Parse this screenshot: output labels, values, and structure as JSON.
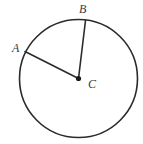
{
  "figure": {
    "kind": "geometry-diagram",
    "background_color": "#ffffff",
    "stroke_color": "#2b2b2b",
    "label_color": "#3a3a3a",
    "dot_color": "#1a1a1a",
    "circle": {
      "center_x": 78.5,
      "center_y": 78.5,
      "radius": 59,
      "stroke_width": 1.6
    },
    "center_dot": {
      "x": 78.5,
      "y": 78.5,
      "radius": 2.6
    },
    "radii": [
      {
        "name": "radius-CA",
        "from_x": 78.5,
        "from_y": 78.5,
        "to_x": 25,
        "to_y": 51.5,
        "stroke_width": 1.6
      },
      {
        "name": "radius-CB",
        "from_x": 78.5,
        "from_y": 78.5,
        "to_x": 85.5,
        "to_y": 20.5,
        "stroke_width": 1.6
      }
    ],
    "labels": [
      {
        "name": "label-A",
        "text": "A",
        "x": 12,
        "y": 42
      },
      {
        "name": "label-B",
        "text": "B",
        "x": 79,
        "y": 3
      },
      {
        "name": "label-C",
        "text": "C",
        "x": 88,
        "y": 78
      }
    ]
  },
  "chart_data": {
    "type": "diagram",
    "title": "",
    "shapes": [
      {
        "shape": "circle",
        "label": "circle centered at C",
        "center": [
          78.5,
          78.5
        ],
        "radius": 59
      },
      {
        "shape": "segment",
        "label": "CA",
        "endpoints": [
          [
            78.5,
            78.5
          ],
          [
            25,
            51.5
          ]
        ]
      },
      {
        "shape": "segment",
        "label": "CB",
        "endpoints": [
          [
            78.5,
            78.5
          ],
          [
            85.5,
            20.5
          ]
        ]
      },
      {
        "shape": "point",
        "label": "C",
        "position": [
          78.5,
          78.5
        ]
      },
      {
        "shape": "point",
        "label": "A",
        "position": [
          25,
          51.5
        ]
      },
      {
        "shape": "point",
        "label": "B",
        "position": [
          85.5,
          20.5
        ]
      }
    ],
    "annotations": [
      "A",
      "B",
      "C"
    ]
  }
}
